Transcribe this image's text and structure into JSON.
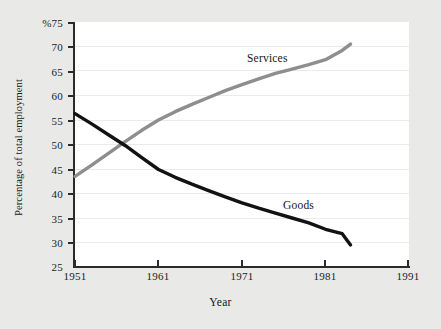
{
  "chart_data": {
    "type": "line",
    "title": "",
    "xlabel": "Year",
    "ylabel": "Percentage of total employment",
    "ylim": [
      25,
      75
    ],
    "xlim": [
      1951,
      1991
    ],
    "yticks": [
      25,
      30,
      35,
      40,
      45,
      50,
      55,
      60,
      65,
      70,
      75
    ],
    "ytick_labels": [
      "25",
      "30",
      "35",
      "40",
      "45",
      "50",
      "55",
      "60",
      "65",
      "70",
      "%75"
    ],
    "xticks": [
      1951,
      1961,
      1971,
      1981,
      1991
    ],
    "xtick_labels": [
      "1951",
      "1961",
      "1971",
      "1981",
      "1991"
    ],
    "grid": true,
    "legend_position": "inline-annotation",
    "unit": "%",
    "series": [
      {
        "name": "Services",
        "color": "#8e8e8e",
        "annotation": "Services",
        "x": [
          1951,
          1953,
          1955,
          1957,
          1959,
          1961,
          1963,
          1965,
          1967,
          1969,
          1971,
          1973,
          1975,
          1977,
          1979,
          1981,
          1983,
          1984
        ],
        "values": [
          43.5,
          45.8,
          48.2,
          50.6,
          52.9,
          55.0,
          56.7,
          58.2,
          59.6,
          61.0,
          62.2,
          63.4,
          64.5,
          65.4,
          66.3,
          67.3,
          69.2,
          70.5
        ]
      },
      {
        "name": "Goods",
        "color": "#121212",
        "annotation": "Goods",
        "x": [
          1951,
          1953,
          1955,
          1957,
          1959,
          1961,
          1963,
          1965,
          1967,
          1969,
          1971,
          1973,
          1975,
          1977,
          1979,
          1981,
          1983,
          1984
        ],
        "values": [
          56.3,
          54.2,
          52.0,
          49.8,
          47.3,
          44.9,
          43.3,
          41.9,
          40.6,
          39.3,
          38.1,
          37.0,
          36.0,
          35.0,
          34.0,
          32.7,
          31.8,
          29.5
        ]
      }
    ]
  },
  "axis": {
    "y_title": "Percentage of total employment",
    "x_title": "Year"
  }
}
